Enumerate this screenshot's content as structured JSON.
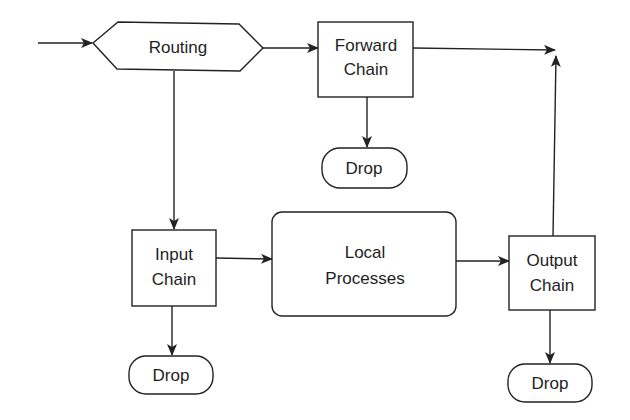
{
  "diagram": {
    "type": "flowchart",
    "colors": {
      "stroke": "#222222",
      "background": "#ffffff",
      "text": "#1e1e1e"
    },
    "nodes": {
      "routing": {
        "label": "Routing",
        "shape": "hexagon"
      },
      "forward_chain": {
        "line1": "Forward",
        "line2": "Chain",
        "shape": "rectangle"
      },
      "forward_drop": {
        "label": "Drop",
        "shape": "pill"
      },
      "input_chain": {
        "line1": "Input",
        "line2": "Chain",
        "shape": "rectangle"
      },
      "input_drop": {
        "label": "Drop",
        "shape": "pill"
      },
      "local_processes": {
        "line1": "Local",
        "line2": "Processes",
        "shape": "rounded-rectangle"
      },
      "output_chain": {
        "line1": "Output",
        "line2": "Chain",
        "shape": "rectangle"
      },
      "output_drop": {
        "label": "Drop",
        "shape": "pill"
      }
    },
    "edges": [
      {
        "from": "entry",
        "to": "Routing"
      },
      {
        "from": "Routing",
        "to": "Forward Chain"
      },
      {
        "from": "Routing",
        "to": "Input Chain"
      },
      {
        "from": "Forward Chain",
        "to": "Drop"
      },
      {
        "from": "Forward Chain",
        "to": "exit"
      },
      {
        "from": "Input Chain",
        "to": "Local Processes"
      },
      {
        "from": "Input Chain",
        "to": "Drop"
      },
      {
        "from": "Local Processes",
        "to": "Output Chain"
      },
      {
        "from": "Output Chain",
        "to": "Drop"
      },
      {
        "from": "Output Chain",
        "to": "exit"
      }
    ]
  }
}
